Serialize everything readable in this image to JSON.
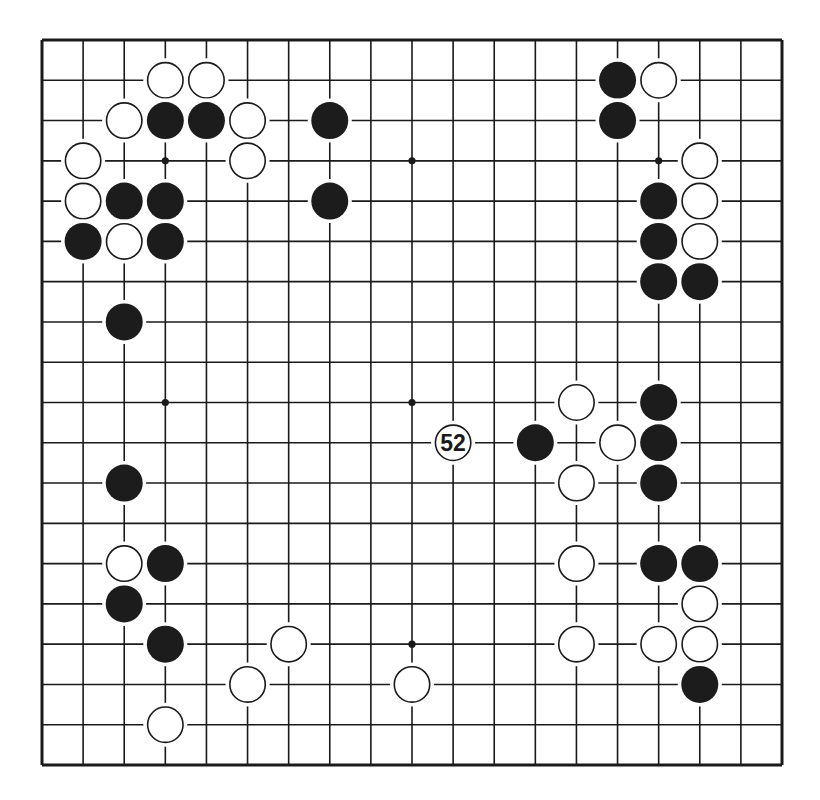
{
  "diagram": {
    "type": "go-board",
    "size": 19,
    "colors": {
      "background": "#ffffff",
      "line": "#1a1a1a",
      "black_stone": "#1c1c1c",
      "white_stone": "#ffffff",
      "stone_outline": "#1a1a1a"
    },
    "geometry": {
      "x0": 42,
      "y0": 40,
      "x1": 782,
      "y1": 765
    },
    "hoshi": [
      [
        3,
        3
      ],
      [
        9,
        3
      ],
      [
        15,
        3
      ],
      [
        3,
        9
      ],
      [
        9,
        9
      ],
      [
        15,
        9
      ],
      [
        3,
        15
      ],
      [
        9,
        15
      ],
      [
        15,
        15
      ]
    ],
    "stones": [
      {
        "color": "white",
        "col": 3,
        "row": 1
      },
      {
        "color": "white",
        "col": 4,
        "row": 1
      },
      {
        "color": "white",
        "col": 2,
        "row": 2
      },
      {
        "color": "black",
        "col": 3,
        "row": 2
      },
      {
        "color": "black",
        "col": 4,
        "row": 2
      },
      {
        "color": "white",
        "col": 5,
        "row": 2
      },
      {
        "color": "black",
        "col": 7,
        "row": 2
      },
      {
        "color": "white",
        "col": 1,
        "row": 3
      },
      {
        "color": "white",
        "col": 5,
        "row": 3
      },
      {
        "color": "white",
        "col": 1,
        "row": 4
      },
      {
        "color": "black",
        "col": 2,
        "row": 4
      },
      {
        "color": "black",
        "col": 3,
        "row": 4
      },
      {
        "color": "black",
        "col": 7,
        "row": 4
      },
      {
        "color": "black",
        "col": 1,
        "row": 5
      },
      {
        "color": "white",
        "col": 2,
        "row": 5
      },
      {
        "color": "black",
        "col": 3,
        "row": 5
      },
      {
        "color": "black",
        "col": 2,
        "row": 7
      },
      {
        "color": "black",
        "col": 14,
        "row": 1
      },
      {
        "color": "white",
        "col": 15,
        "row": 1
      },
      {
        "color": "black",
        "col": 14,
        "row": 2
      },
      {
        "color": "white",
        "col": 16,
        "row": 3
      },
      {
        "color": "black",
        "col": 15,
        "row": 4
      },
      {
        "color": "white",
        "col": 16,
        "row": 4
      },
      {
        "color": "black",
        "col": 15,
        "row": 5
      },
      {
        "color": "white",
        "col": 16,
        "row": 5
      },
      {
        "color": "black",
        "col": 15,
        "row": 6
      },
      {
        "color": "black",
        "col": 16,
        "row": 6
      },
      {
        "color": "white",
        "col": 13,
        "row": 9
      },
      {
        "color": "black",
        "col": 15,
        "row": 9
      },
      {
        "color": "white",
        "col": 10,
        "row": 10,
        "label": "52"
      },
      {
        "color": "black",
        "col": 12,
        "row": 10
      },
      {
        "color": "white",
        "col": 14,
        "row": 10
      },
      {
        "color": "black",
        "col": 15,
        "row": 10
      },
      {
        "color": "black",
        "col": 2,
        "row": 11
      },
      {
        "color": "white",
        "col": 13,
        "row": 11
      },
      {
        "color": "black",
        "col": 15,
        "row": 11
      },
      {
        "color": "white",
        "col": 2,
        "row": 13
      },
      {
        "color": "black",
        "col": 3,
        "row": 13
      },
      {
        "color": "white",
        "col": 13,
        "row": 13
      },
      {
        "color": "black",
        "col": 15,
        "row": 13
      },
      {
        "color": "black",
        "col": 16,
        "row": 13
      },
      {
        "color": "black",
        "col": 2,
        "row": 14
      },
      {
        "color": "white",
        "col": 16,
        "row": 14
      },
      {
        "color": "black",
        "col": 3,
        "row": 15
      },
      {
        "color": "white",
        "col": 6,
        "row": 15
      },
      {
        "color": "white",
        "col": 13,
        "row": 15
      },
      {
        "color": "white",
        "col": 15,
        "row": 15
      },
      {
        "color": "white",
        "col": 16,
        "row": 15
      },
      {
        "color": "white",
        "col": 5,
        "row": 16
      },
      {
        "color": "white",
        "col": 9,
        "row": 16
      },
      {
        "color": "black",
        "col": 16,
        "row": 16
      },
      {
        "color": "white",
        "col": 3,
        "row": 17
      }
    ],
    "move_labels": [
      {
        "text": "52",
        "col": 10,
        "row": 10
      }
    ]
  }
}
